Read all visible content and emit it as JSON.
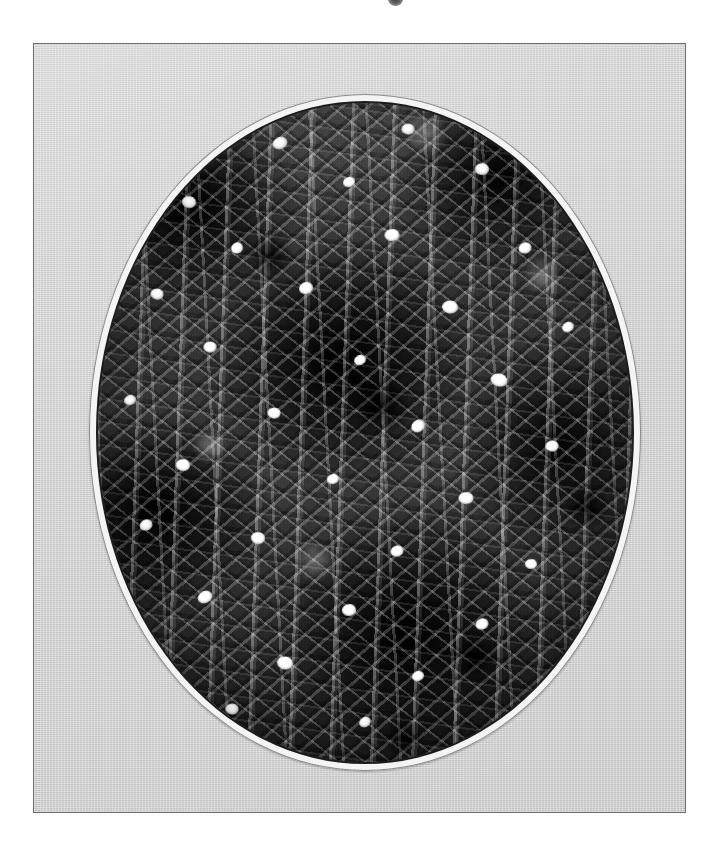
{
  "page": {
    "background_color": "#ffffff",
    "width": 718,
    "height": 855,
    "artifact_label": "scan-artifact-mark"
  },
  "frame": {
    "name": "photographic-plate",
    "mat_color": "#d2d2d2",
    "border_color": "#6e6e6e",
    "x": 33,
    "y": 43,
    "width": 653,
    "height": 770
  },
  "oval": {
    "name": "oval-vignette",
    "ring_color": "#f4f4f2",
    "keyline_color": "#1c1c1c",
    "x": 88,
    "y": 93,
    "width": 552,
    "height": 677
  },
  "photograph": {
    "name": "plant-photograph",
    "medium": "black-and-white halftone print",
    "subject": "flowering herb plant with narrow leaves and small white tubular flowers",
    "orientation": "vertical stems",
    "tone_range": "deep black shadows to bright white flower highlights",
    "caption": ""
  },
  "flower_spots": [
    {
      "x": 34,
      "y": 6,
      "w": 15,
      "h": 12,
      "r": -14
    },
    {
      "x": 58,
      "y": 4,
      "w": 13,
      "h": 11,
      "r": 10
    },
    {
      "x": 17,
      "y": 15,
      "w": 14,
      "h": 12,
      "r": 22
    },
    {
      "x": 47,
      "y": 12,
      "w": 12,
      "h": 10,
      "r": -8
    },
    {
      "x": 72,
      "y": 10,
      "w": 14,
      "h": 12,
      "r": 16
    },
    {
      "x": 26,
      "y": 22,
      "w": 12,
      "h": 11,
      "r": -20
    },
    {
      "x": 55,
      "y": 20,
      "w": 15,
      "h": 12,
      "r": 6
    },
    {
      "x": 80,
      "y": 22,
      "w": 13,
      "h": 11,
      "r": -12
    },
    {
      "x": 11,
      "y": 29,
      "w": 13,
      "h": 11,
      "r": 18
    },
    {
      "x": 39,
      "y": 28,
      "w": 14,
      "h": 12,
      "r": -6
    },
    {
      "x": 66,
      "y": 31,
      "w": 16,
      "h": 13,
      "r": 12
    },
    {
      "x": 88,
      "y": 34,
      "w": 12,
      "h": 10,
      "r": -18
    },
    {
      "x": 21,
      "y": 37,
      "w": 13,
      "h": 11,
      "r": 8
    },
    {
      "x": 49,
      "y": 39,
      "w": 12,
      "h": 10,
      "r": -14
    },
    {
      "x": 75,
      "y": 42,
      "w": 17,
      "h": 13,
      "r": 20
    },
    {
      "x": 6,
      "y": 45,
      "w": 12,
      "h": 10,
      "r": -10
    },
    {
      "x": 33,
      "y": 47,
      "w": 13,
      "h": 11,
      "r": 14
    },
    {
      "x": 60,
      "y": 49,
      "w": 14,
      "h": 12,
      "r": -22
    },
    {
      "x": 85,
      "y": 52,
      "w": 13,
      "h": 11,
      "r": 6
    },
    {
      "x": 16,
      "y": 55,
      "w": 14,
      "h": 12,
      "r": 18
    },
    {
      "x": 44,
      "y": 57,
      "w": 12,
      "h": 10,
      "r": -8
    },
    {
      "x": 69,
      "y": 60,
      "w": 15,
      "h": 12,
      "r": 10
    },
    {
      "x": 9,
      "y": 64,
      "w": 13,
      "h": 11,
      "r": -16
    },
    {
      "x": 30,
      "y": 66,
      "w": 14,
      "h": 12,
      "r": 20
    },
    {
      "x": 56,
      "y": 68,
      "w": 13,
      "h": 11,
      "r": -6
    },
    {
      "x": 81,
      "y": 70,
      "w": 12,
      "h": 10,
      "r": 12
    },
    {
      "x": 20,
      "y": 75,
      "w": 15,
      "h": 12,
      "r": -18
    },
    {
      "x": 47,
      "y": 77,
      "w": 14,
      "h": 12,
      "r": 8
    },
    {
      "x": 72,
      "y": 79,
      "w": 13,
      "h": 11,
      "r": -12
    },
    {
      "x": 35,
      "y": 85,
      "w": 16,
      "h": 13,
      "r": 16
    },
    {
      "x": 60,
      "y": 87,
      "w": 12,
      "h": 10,
      "r": -10
    },
    {
      "x": 25,
      "y": 92,
      "w": 13,
      "h": 11,
      "r": 14
    },
    {
      "x": 50,
      "y": 94,
      "w": 12,
      "h": 10,
      "r": -20
    }
  ]
}
